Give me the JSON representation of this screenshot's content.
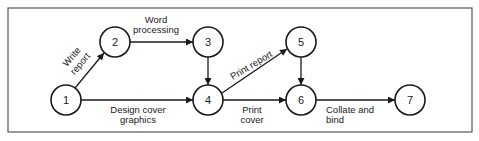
{
  "diagram": {
    "type": "activity-on-arrow network",
    "frame": {
      "x": 8,
      "y": 8,
      "width": 464,
      "height": 124
    },
    "node_radius": 15,
    "nodes": [
      {
        "id": "1",
        "label": "1",
        "x": 66,
        "y": 100
      },
      {
        "id": "2",
        "label": "2",
        "x": 115,
        "y": 42
      },
      {
        "id": "3",
        "label": "3",
        "x": 208,
        "y": 42
      },
      {
        "id": "4",
        "label": "4",
        "x": 208,
        "y": 100
      },
      {
        "id": "5",
        "label": "5",
        "x": 301,
        "y": 42
      },
      {
        "id": "6",
        "label": "6",
        "x": 301,
        "y": 100
      },
      {
        "id": "7",
        "label": "7",
        "x": 410,
        "y": 100
      }
    ],
    "edges": [
      {
        "from": "1",
        "to": "2",
        "label_lines": [
          "Write",
          "report"
        ]
      },
      {
        "from": "2",
        "to": "3",
        "label_lines": [
          "Word",
          "processing"
        ]
      },
      {
        "from": "3",
        "to": "4",
        "label_lines": []
      },
      {
        "from": "1",
        "to": "4",
        "label_lines": [
          "Design cover",
          "graphics"
        ]
      },
      {
        "from": "4",
        "to": "5",
        "label_lines": [
          "Print report"
        ]
      },
      {
        "from": "4",
        "to": "6",
        "label_lines": [
          "Print",
          "cover"
        ]
      },
      {
        "from": "5",
        "to": "6",
        "label_lines": []
      },
      {
        "from": "6",
        "to": "7",
        "label_lines": [
          "Collate and",
          "bind"
        ]
      }
    ],
    "colors": {
      "stroke": "#1a1a1a",
      "frame": "#555555",
      "background": "#ffffff"
    }
  }
}
